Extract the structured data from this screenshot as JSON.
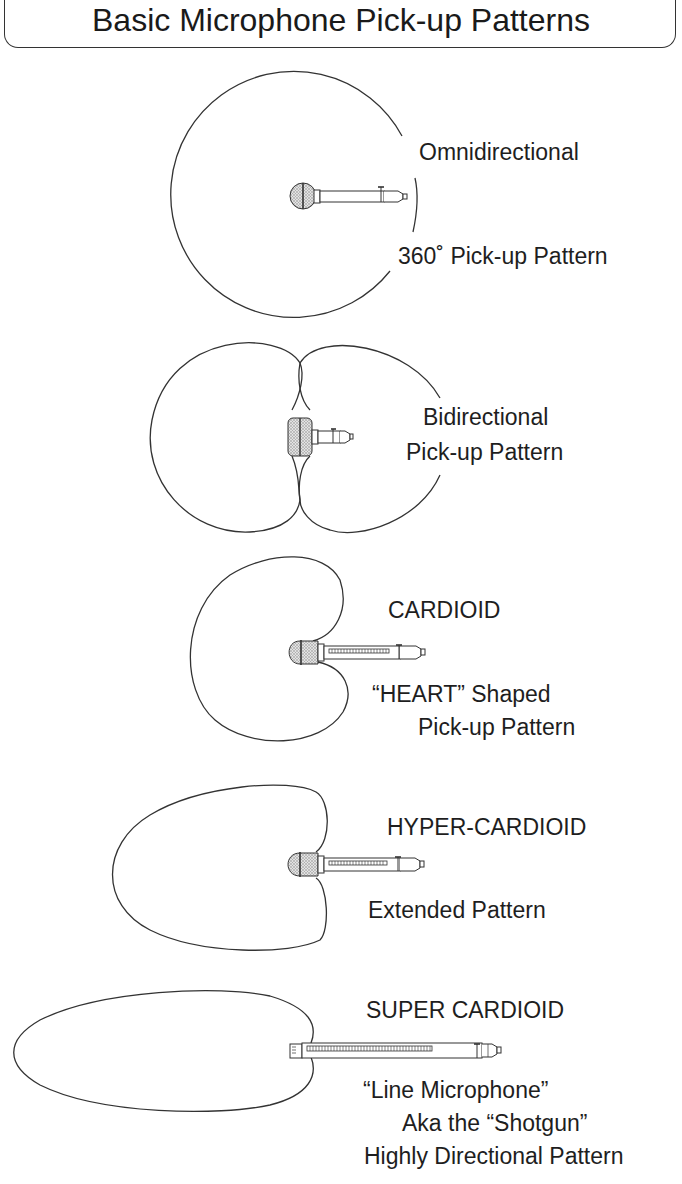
{
  "title": "Basic Microphone Pick-up Patterns",
  "patterns": [
    {
      "name": "omnidirectional",
      "labels": [
        "Omnidirectional",
        "360˚ Pick-up Pattern"
      ]
    },
    {
      "name": "bidirectional",
      "labels": [
        "Bidirectional",
        "Pick-up Pattern"
      ]
    },
    {
      "name": "cardioid",
      "labels": [
        "CARDIOID",
        "“HEART” Shaped",
        "Pick-up Pattern"
      ]
    },
    {
      "name": "hyper-cardioid",
      "labels": [
        "HYPER-CARDIOID",
        "Extended Pattern"
      ]
    },
    {
      "name": "super-cardioid",
      "labels": [
        "SUPER CARDIOID",
        "“Line Microphone”",
        "Aka the “Shotgun”",
        "Highly Directional Pattern"
      ]
    }
  ],
  "colors": {
    "line": "#333333",
    "mesh_fill": "#d9d9d9",
    "background": "#ffffff"
  }
}
